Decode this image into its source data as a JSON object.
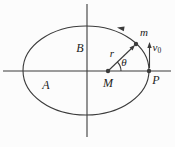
{
  "diagram": {
    "type": "physics-orbit-diagram",
    "labels": {
      "region_lower_left": "A",
      "region_upper": "B",
      "central_mass": "M",
      "right_vertex": "P",
      "satellite": "m",
      "radius": "r",
      "angle": "θ",
      "velocity_base": "v",
      "velocity_sub": "0"
    },
    "colors": {
      "line": "#3b3b3b",
      "text": "#222222",
      "background": "#fcfcfc"
    }
  }
}
